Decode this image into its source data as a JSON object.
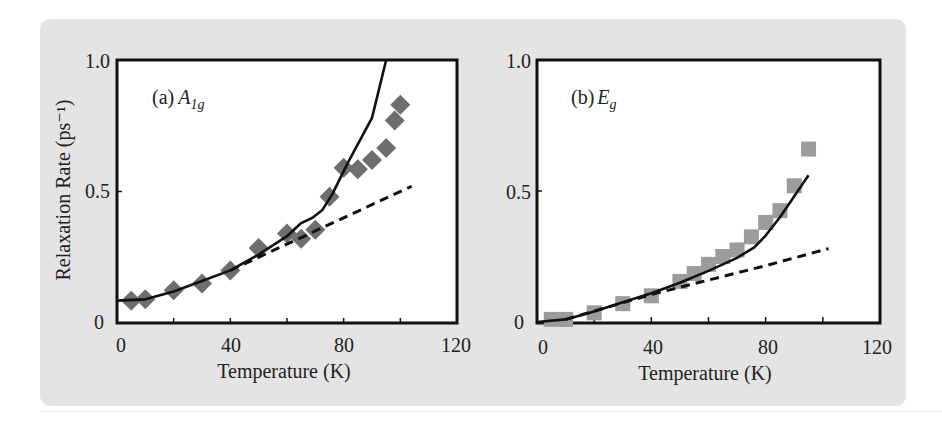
{
  "figure": {
    "background_color": "#e4e4e4",
    "marker_color_a": "#6e6e6e",
    "marker_color_b": "#9c9c9c",
    "line_color": "#111111"
  },
  "chart_data": [
    {
      "type": "scatter",
      "panel_label": "(a)",
      "panel_symbol": "A",
      "panel_symbol_sub": "1g",
      "xlabel": "Temperature (K)",
      "ylabel": "Relaxation Rate (ps⁻¹)",
      "xlim": [
        0,
        120
      ],
      "ylim": [
        0,
        1.0
      ],
      "xticks": [
        0,
        40,
        80,
        120
      ],
      "xtick_labels": [
        "0",
        "40",
        "80",
        "120"
      ],
      "minor_xticks": [
        20,
        60,
        100
      ],
      "yticks": [
        0,
        0.5,
        1.0
      ],
      "ytick_labels": [
        "0",
        "0.5",
        "1.0"
      ],
      "grid": false,
      "series": [
        {
          "name": "experiment",
          "kind": "markers",
          "marker": "diamond",
          "x": [
            5,
            10,
            20,
            30,
            40,
            50,
            60,
            65,
            70,
            75,
            80,
            85,
            90,
            95,
            98,
            100
          ],
          "y": [
            0.085,
            0.09,
            0.125,
            0.15,
            0.2,
            0.285,
            0.34,
            0.32,
            0.355,
            0.48,
            0.59,
            0.585,
            0.62,
            0.665,
            0.77,
            0.83
          ]
        },
        {
          "name": "model (solid)",
          "kind": "line",
          "style": "solid",
          "x": [
            0,
            10,
            20,
            30,
            40,
            50,
            60,
            65,
            69,
            72.5,
            76,
            81.5,
            90,
            95
          ],
          "y": [
            0.085,
            0.09,
            0.12,
            0.16,
            0.2,
            0.26,
            0.33,
            0.38,
            0.4,
            0.43,
            0.49,
            0.61,
            0.78,
            1.0
          ]
        },
        {
          "name": "model (dashed)",
          "kind": "line",
          "style": "dashed",
          "x": [
            40,
            104
          ],
          "y": [
            0.2,
            0.52
          ]
        }
      ]
    },
    {
      "type": "scatter",
      "panel_label": "(b)",
      "panel_symbol": "E",
      "panel_symbol_sub": "g",
      "xlabel": "Temperature (K)",
      "ylabel": "",
      "xlim": [
        0,
        120
      ],
      "ylim": [
        0,
        1.0
      ],
      "xticks": [
        0,
        40,
        80,
        120
      ],
      "xtick_labels": [
        "0",
        "40",
        "80",
        "120"
      ],
      "minor_xticks": [
        20,
        60,
        100
      ],
      "yticks": [
        0,
        0.5,
        1.0
      ],
      "ytick_labels": [
        "0",
        "0.5",
        "1.0"
      ],
      "grid": false,
      "series": [
        {
          "name": "experiment",
          "kind": "markers",
          "marker": "square",
          "x": [
            5,
            10,
            20,
            30,
            40,
            50,
            55,
            60,
            65,
            70,
            75,
            80,
            85,
            90,
            95
          ],
          "y": [
            0.01,
            0.01,
            0.035,
            0.07,
            0.1,
            0.155,
            0.185,
            0.22,
            0.25,
            0.275,
            0.325,
            0.38,
            0.425,
            0.52,
            0.66
          ]
        },
        {
          "name": "model (solid)",
          "kind": "line",
          "style": "solid",
          "x": [
            0,
            10,
            20,
            30,
            40,
            50,
            60,
            70,
            76,
            80,
            85,
            90,
            95
          ],
          "y": [
            0.0,
            0.01,
            0.04,
            0.075,
            0.11,
            0.15,
            0.195,
            0.245,
            0.285,
            0.33,
            0.4,
            0.48,
            0.56
          ]
        },
        {
          "name": "model (dashed)",
          "kind": "line",
          "style": "dashed",
          "x": [
            10,
            40,
            60,
            80,
            102
          ],
          "y": [
            0.01,
            0.105,
            0.16,
            0.215,
            0.28
          ]
        }
      ]
    }
  ]
}
